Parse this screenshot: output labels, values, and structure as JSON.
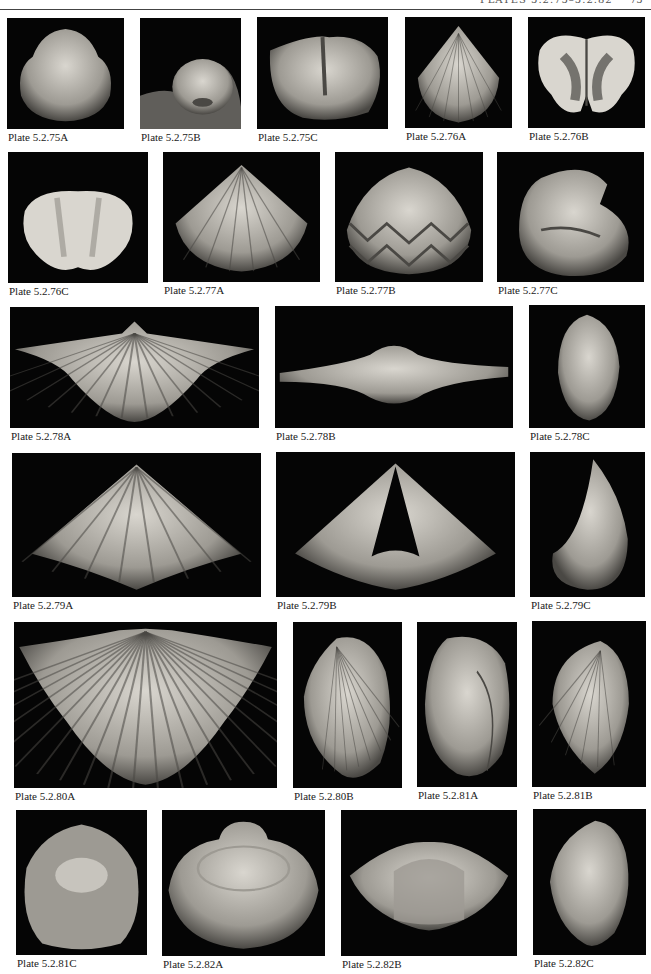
{
  "header": {
    "running_title": "PLATES 5.2.75–5.2.82",
    "page_number": "75"
  },
  "plates": [
    {
      "id": "5.2.75A",
      "label": "Plate 5.2.75A",
      "shape": "round-shell",
      "x": 7,
      "y": 18,
      "w": 117,
      "h": 111
    },
    {
      "id": "5.2.75B",
      "label": "Plate 5.2.75B",
      "shape": "dome-shell",
      "x": 140,
      "y": 18,
      "w": 101,
      "h": 111
    },
    {
      "id": "5.2.75C",
      "label": "Plate 5.2.75C",
      "shape": "interior-valve",
      "x": 257,
      "y": 17,
      "w": 131,
      "h": 112
    },
    {
      "id": "5.2.76A",
      "label": "Plate 5.2.76A",
      "shape": "ribbed-triangle",
      "x": 405,
      "y": 17,
      "w": 107,
      "h": 111
    },
    {
      "id": "5.2.76B",
      "label": "Plate 5.2.76B",
      "shape": "butterfly-interior",
      "x": 528,
      "y": 17,
      "w": 117,
      "h": 111
    },
    {
      "id": "5.2.76C",
      "label": "Plate 5.2.76C",
      "shape": "lobed-interior",
      "x": 8,
      "y": 152,
      "w": 140,
      "h": 131
    },
    {
      "id": "5.2.77A",
      "label": "Plate 5.2.77A",
      "shape": "plicate-shell",
      "x": 163,
      "y": 152,
      "w": 157,
      "h": 130
    },
    {
      "id": "5.2.77B",
      "label": "Plate 5.2.77B",
      "shape": "zigzag-commissure",
      "x": 335,
      "y": 152,
      "w": 148,
      "h": 130
    },
    {
      "id": "5.2.77C",
      "label": "Plate 5.2.77C",
      "shape": "lateral-curved",
      "x": 497,
      "y": 152,
      "w": 147,
      "h": 130
    },
    {
      "id": "5.2.78A",
      "label": "Plate 5.2.78A",
      "shape": "wide-spirifer",
      "x": 10,
      "y": 307,
      "w": 249,
      "h": 121
    },
    {
      "id": "5.2.78B",
      "label": "Plate 5.2.78B",
      "shape": "winged-anterior",
      "x": 275,
      "y": 306,
      "w": 238,
      "h": 122
    },
    {
      "id": "5.2.78C",
      "label": "Plate 5.2.78C",
      "shape": "narrow-lateral",
      "x": 529,
      "y": 305,
      "w": 116,
      "h": 123
    },
    {
      "id": "5.2.79A",
      "label": "Plate 5.2.79A",
      "shape": "pyramid-ventral",
      "x": 12,
      "y": 453,
      "w": 249,
      "h": 144
    },
    {
      "id": "5.2.79B",
      "label": "Plate 5.2.79B",
      "shape": "pyramid-open",
      "x": 276,
      "y": 452,
      "w": 239,
      "h": 145
    },
    {
      "id": "5.2.79C",
      "label": "Plate 5.2.79C",
      "shape": "cone-lateral",
      "x": 530,
      "y": 452,
      "w": 115,
      "h": 145
    },
    {
      "id": "5.2.80A",
      "label": "Plate 5.2.80A",
      "shape": "fan-costate",
      "x": 14,
      "y": 622,
      "w": 263,
      "h": 166
    },
    {
      "id": "5.2.80B",
      "label": "Plate 5.2.80B",
      "shape": "heart-lateral",
      "x": 293,
      "y": 622,
      "w": 109,
      "h": 166
    },
    {
      "id": "5.2.81A",
      "label": "Plate 5.2.81A",
      "shape": "globose-lateral",
      "x": 417,
      "y": 622,
      "w": 100,
      "h": 165
    },
    {
      "id": "5.2.81B",
      "label": "Plate 5.2.81B",
      "shape": "heart-lateral-b",
      "x": 532,
      "y": 621,
      "w": 114,
      "h": 166
    },
    {
      "id": "5.2.81C",
      "label": "Plate 5.2.81C",
      "shape": "dark-interior",
      "x": 16,
      "y": 810,
      "w": 131,
      "h": 145
    },
    {
      "id": "5.2.82A",
      "label": "Plate 5.2.82A",
      "shape": "oval-interior",
      "x": 162,
      "y": 810,
      "w": 163,
      "h": 146
    },
    {
      "id": "5.2.82B",
      "label": "Plate 5.2.82B",
      "shape": "anterior-fold",
      "x": 341,
      "y": 810,
      "w": 176,
      "h": 146
    },
    {
      "id": "5.2.82C",
      "label": "Plate 5.2.82C",
      "shape": "heart-lateral-c",
      "x": 533,
      "y": 809,
      "w": 113,
      "h": 146
    }
  ],
  "colors": {
    "photo_background": "#050505",
    "shell_light": "#d9d6cf",
    "shell_mid": "#9d9a93",
    "shell_dark": "#4a4844",
    "label_text": "#1a1a1a"
  }
}
